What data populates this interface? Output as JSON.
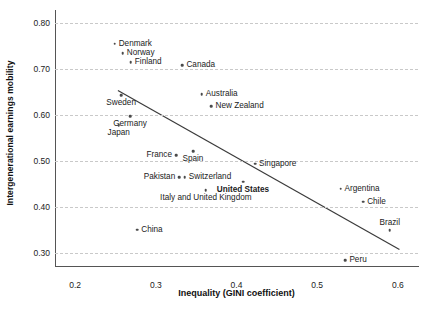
{
  "chart_data": {
    "type": "scatter",
    "title": "",
    "xlabel": "Inequality (GINI coefficient)",
    "ylabel": "Intergenerational earnings mobility",
    "xlim": [
      0.175,
      0.625
    ],
    "ylim": [
      0.272,
      0.828
    ],
    "grid": true,
    "legend": null,
    "xticks": [
      "0.2",
      "0.3",
      "0.4",
      "0.5",
      "0.6"
    ],
    "xtick_values": [
      0.2,
      0.3,
      0.4,
      0.5,
      0.6
    ],
    "yticks": [
      "0.30",
      "0.40",
      "0.50",
      "0.60",
      "0.70",
      "0.80"
    ],
    "ytick_values": [
      0.3,
      0.4,
      0.5,
      0.6,
      0.7,
      0.8
    ],
    "points": [
      {
        "label": "Denmark",
        "x": 0.249,
        "y": 0.755,
        "pos": "right",
        "bold": false
      },
      {
        "label": "Norway",
        "x": 0.259,
        "y": 0.734,
        "pos": "right",
        "bold": false
      },
      {
        "label": "Finland",
        "x": 0.269,
        "y": 0.715,
        "pos": "right",
        "bold": false
      },
      {
        "label": "Canada",
        "x": 0.333,
        "y": 0.708,
        "pos": "right",
        "bold": false
      },
      {
        "label": "Sweden",
        "x": 0.257,
        "y": 0.643,
        "pos": "below",
        "bold": false
      },
      {
        "label": "Australia",
        "x": 0.357,
        "y": 0.645,
        "pos": "right",
        "bold": false
      },
      {
        "label": "New Zealand",
        "x": 0.369,
        "y": 0.619,
        "pos": "right",
        "bold": false
      },
      {
        "label": "Germany",
        "x": 0.268,
        "y": 0.597,
        "pos": "below",
        "bold": false
      },
      {
        "label": "Japan",
        "x": 0.254,
        "y": 0.578,
        "pos": "below",
        "bold": false
      },
      {
        "label": "Spain",
        "x": 0.346,
        "y": 0.521,
        "pos": "below",
        "bold": false
      },
      {
        "label": "France",
        "x": 0.325,
        "y": 0.513,
        "pos": "left",
        "bold": false
      },
      {
        "label": "Pakistan",
        "x": 0.329,
        "y": 0.465,
        "pos": "left",
        "bold": false
      },
      {
        "label": "Switzerland",
        "x": 0.336,
        "y": 0.465,
        "pos": "right",
        "bold": false
      },
      {
        "label": "Singapore",
        "x": 0.423,
        "y": 0.494,
        "pos": "right",
        "bold": false
      },
      {
        "label": "United States",
        "x": 0.408,
        "y": 0.455,
        "pos": "below",
        "bold": true
      },
      {
        "label": "Italy and United Kingdom",
        "x": 0.362,
        "y": 0.437,
        "pos": "below",
        "bold": false
      },
      {
        "label": "Argentina",
        "x": 0.529,
        "y": 0.44,
        "pos": "right",
        "bold": false
      },
      {
        "label": "Chile",
        "x": 0.557,
        "y": 0.412,
        "pos": "right",
        "bold": false
      },
      {
        "label": "Brazil",
        "x": 0.59,
        "y": 0.35,
        "pos": "above",
        "bold": false
      },
      {
        "label": "China",
        "x": 0.277,
        "y": 0.351,
        "pos": "right",
        "bold": false
      },
      {
        "label": "Peru",
        "x": 0.535,
        "y": 0.285,
        "pos": "right",
        "bold": false
      }
    ],
    "trend_line": {
      "x0": 0.253,
      "y0": 0.653,
      "x1": 0.602,
      "y1": 0.308,
      "color": "#3a3a3a"
    }
  }
}
